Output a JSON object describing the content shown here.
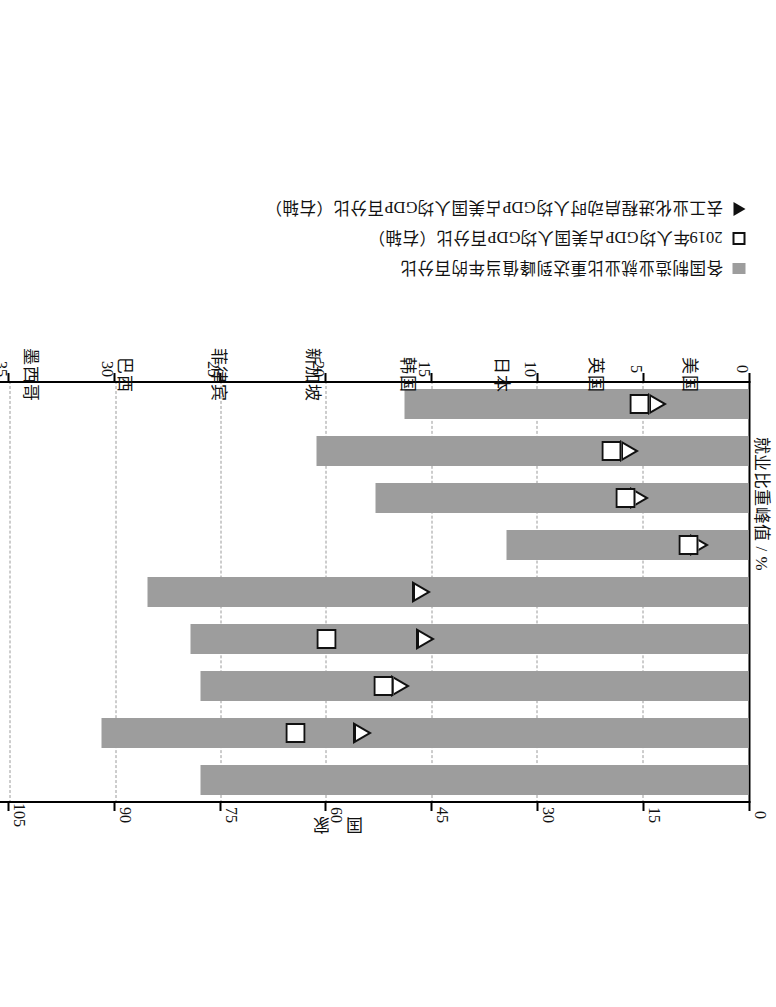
{
  "chart_data": {
    "type": "bar",
    "orientation": "vertical-rotated",
    "title": "",
    "xlabel": "国 家",
    "ylabel": "就业比重峰值 / %",
    "y2label": "占美国人均GDP百分比 / %",
    "ylim": [
      0,
      40
    ],
    "y2lim": [
      0,
      120
    ],
    "grid": true,
    "legend_position": "bottom-left",
    "categories": [
      "美国",
      "英国",
      "日本",
      "韩国",
      "新加坡",
      "菲律宾",
      "巴西",
      "墨西哥",
      "中国"
    ],
    "ytick_labels": [
      "0",
      "5",
      "10",
      "15",
      "20",
      "25",
      "30",
      "35",
      "40"
    ],
    "ytick_values": [
      0,
      5,
      10,
      15,
      20,
      25,
      30,
      35,
      40
    ],
    "y2tick_labels": [
      "0",
      "15",
      "30",
      "45",
      "60",
      "75",
      "90",
      "105",
      "120"
    ],
    "y2tick_values": [
      0,
      15,
      30,
      45,
      60,
      75,
      90,
      105,
      120
    ],
    "series": [
      {
        "name": "各国制造业就业比重达到峰值当年的百分比",
        "marker": "bar",
        "axis": "left",
        "values": [
          26.0,
          30.7,
          26.0,
          26.5,
          28.5,
          11.5,
          17.7,
          20.5,
          16.3
        ]
      },
      {
        "name": "2019年人均GDP占美国人均GDP百分比（右轴）",
        "marker": "square",
        "axis": "right",
        "values": [
          110.0,
          64.5,
          52.0,
          60.0,
          108.0,
          8.5,
          17.5,
          19.5,
          15.5
        ]
      },
      {
        "name": "去工业化进程启动时人均GDP占美国人均GDP百分比（右轴）",
        "marker": "triangle",
        "axis": "right",
        "values": [
          109.0,
          55.0,
          49.5,
          46.0,
          46.5,
          7.0,
          15.5,
          17.0,
          13.0
        ]
      }
    ],
    "colors": {
      "bar": "#9d9d9d",
      "marker_outline": "#111111",
      "marker_fill": "#ffffff",
      "grid": "#9a9a9a",
      "axis": "#000000"
    }
  },
  "legend": {
    "items": [
      {
        "key": "bar-swatch",
        "label": "各国制造业就业比重达到峰值当年的百分比"
      },
      {
        "key": "square-marker",
        "label": "2019年人均GDP占美国人均GDP百分比（右轴）"
      },
      {
        "key": "triangle-marker",
        "label": "去工业化进程启动时人均GDP占美国人均GDP百分比（右轴）"
      }
    ]
  },
  "axes": {
    "left_title": "就业比重峰值 / %",
    "right_title": "占美国人均GDP百分比 / %",
    "category_title": "国 家"
  }
}
